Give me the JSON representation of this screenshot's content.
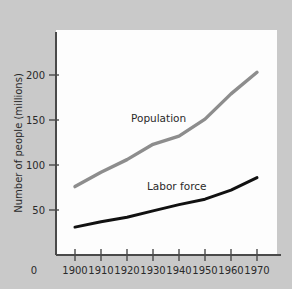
{
  "figure": {
    "background_color": "#c9c9c9",
    "plot_background_color": "#fdfdfd",
    "axis_color": "#4a4a4a"
  },
  "chart_data": {
    "type": "line",
    "title": "",
    "xlabel": "",
    "ylabel": "Number of people (millions)",
    "xlim": [
      1890,
      1980
    ],
    "ylim": [
      0,
      225
    ],
    "grid": false,
    "legend": "inline-labels",
    "xticks": [
      "0",
      "1900",
      "1910",
      "1920",
      "1930",
      "1940",
      "1950",
      "1960",
      "1970"
    ],
    "yticks": [
      "50",
      "100",
      "150",
      "200"
    ],
    "x": [
      1900,
      1910,
      1920,
      1930,
      1940,
      1950,
      1960,
      1970
    ],
    "series": [
      {
        "name": "Population",
        "color": "#8d8d8d",
        "values": [
          76,
          92,
          106,
          123,
          132,
          151,
          179,
          203
        ]
      },
      {
        "name": "Labor force",
        "color": "#111111",
        "values": [
          31,
          37,
          42,
          49,
          56,
          62,
          72,
          86
        ]
      }
    ]
  },
  "annotations": {
    "population_label": "Population",
    "labor_force_label": "Labor force"
  },
  "axis": {
    "y_title": "Number of people (millions)",
    "x_tick_0": "0",
    "x_tick_1900": "1900",
    "x_tick_1910": "1910",
    "x_tick_1920": "1920",
    "x_tick_1930": "1930",
    "x_tick_1940": "1940",
    "x_tick_1950": "1950",
    "x_tick_1960": "1960",
    "x_tick_1970": "1970",
    "y_tick_50": "50",
    "y_tick_100": "100",
    "y_tick_150": "150",
    "y_tick_200": "200"
  }
}
